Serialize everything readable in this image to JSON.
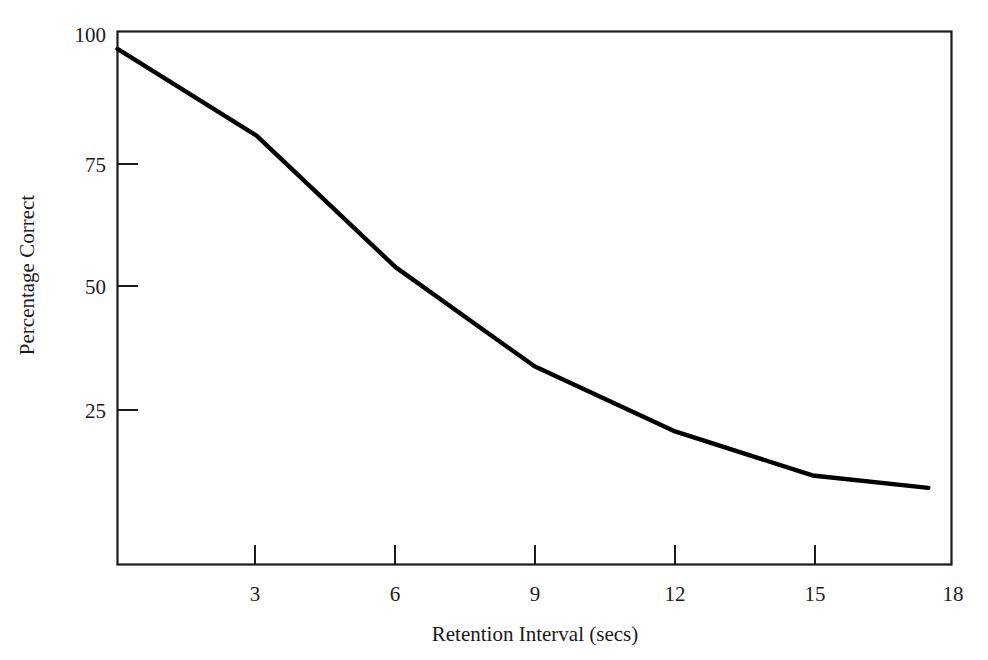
{
  "chart_data": {
    "type": "line",
    "title": "",
    "xlabel": "Retention Interval (secs)",
    "ylabel": "Percentage Correct",
    "xlim": [
      0,
      18
    ],
    "ylim": [
      0,
      100
    ],
    "grid": false,
    "legend": null,
    "x_ticks": [
      "3",
      "6",
      "9",
      "12",
      "15",
      "18"
    ],
    "x_tick_values": [
      3,
      6,
      9,
      12,
      15,
      18
    ],
    "y_ticks": [
      "25",
      "50",
      "75",
      "100"
    ],
    "y_tick_values": [
      25,
      50,
      75,
      100
    ],
    "x": [
      0,
      3,
      6,
      9,
      12,
      15,
      17.5
    ],
    "values": [
      97,
      79.5,
      53,
      33,
      20,
      11,
      8.5
    ],
    "series": [
      {
        "name": "Percentage Correct",
        "x": [
          0,
          3,
          6,
          9,
          12,
          15,
          17.5
        ],
        "values": [
          97,
          79.5,
          53,
          33,
          20,
          11,
          8.5
        ],
        "color": "#000000"
      }
    ]
  },
  "axes": {
    "x_title": "Retention Interval (secs)",
    "y_title": "Percentage Correct",
    "x_tick_labels": [
      "3",
      "6",
      "9",
      "12",
      "15",
      "18"
    ],
    "y_tick_labels": [
      "100",
      "75",
      "50",
      "25"
    ]
  },
  "colors": {
    "background": "#ffffff",
    "line": "#000000",
    "axis": "#1a1a1a",
    "text": "#1a1a1a"
  }
}
